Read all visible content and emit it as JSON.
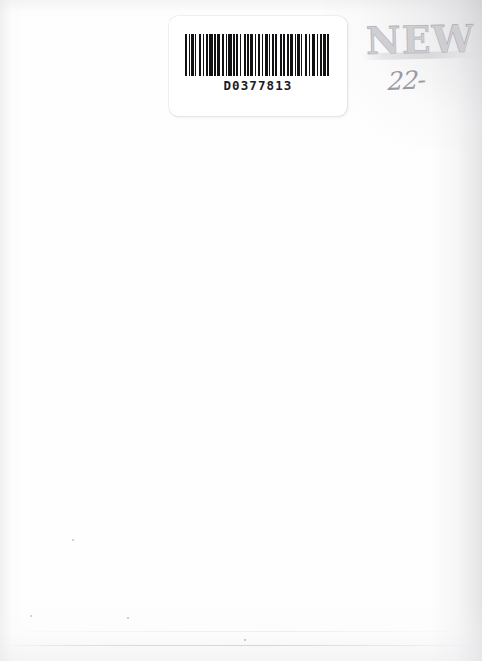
{
  "document": {
    "type": "scanned-book-back-cover",
    "page_background": "#ffffff",
    "width": 482,
    "height": 661
  },
  "barcode_label": {
    "name": "barcode-label",
    "number": "D0377813",
    "ink_color": "#111114",
    "label_background": "#ffffff",
    "bar_pattern": [
      3,
      2,
      2,
      2,
      3,
      2,
      2,
      3,
      4,
      2,
      2,
      2,
      3,
      2,
      5,
      2,
      2,
      2,
      4,
      3,
      3,
      2,
      2,
      2,
      5,
      2,
      2,
      2,
      3,
      2,
      2,
      4,
      2,
      2,
      3,
      2,
      4,
      2,
      2,
      2,
      3,
      3,
      2,
      2,
      4,
      2,
      2,
      2,
      3,
      2,
      2,
      5,
      2,
      2,
      3,
      2,
      3,
      2,
      4,
      2,
      2,
      2,
      3,
      2,
      2,
      3,
      4,
      2,
      2,
      2,
      5,
      2,
      2,
      2,
      3,
      2,
      4,
      2,
      2,
      3
    ]
  },
  "stamp": {
    "name": "new-stamp",
    "text": "NEW",
    "color": "#b2b2b8"
  },
  "annotation": {
    "name": "handwritten-price-mark",
    "text": "22-",
    "color": "#808088"
  },
  "marks": {
    "specks": [
      {
        "x": 73,
        "y": 540,
        "size": 2.2
      },
      {
        "x": 31,
        "y": 616,
        "size": 2.0
      },
      {
        "x": 128,
        "y": 618,
        "size": 2.4
      },
      {
        "x": 245,
        "y": 640,
        "size": 1.6
      }
    ]
  }
}
